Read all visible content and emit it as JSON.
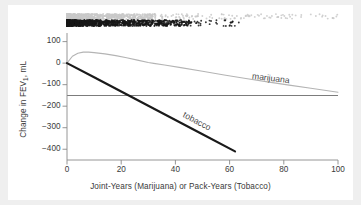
{
  "chart_data": {
    "type": "line",
    "title": "",
    "subtitle": "",
    "xlabel": "Joint-Years (Marijuana) or Pack-Years (Tobacco)",
    "ylabel": "Change in FEV1, mL",
    "ylabel_prefix": "Change in FEV",
    "ylabel_sub": "1",
    "ylabel_suffix": ", mL",
    "xlim": [
      0,
      100
    ],
    "ylim": [
      -450,
      140
    ],
    "xticks": [
      0,
      20,
      40,
      60,
      80,
      100
    ],
    "xtick_labels": [
      "0",
      "20",
      "40",
      "60",
      "80",
      "100"
    ],
    "yticks": [
      100,
      0,
      -100,
      -200,
      -300,
      -400
    ],
    "ytick_labels": [
      "100",
      "0",
      "−100",
      "−200",
      "−300",
      "−400"
    ],
    "grid": false,
    "legend_position": "inline-annotations",
    "zero_reference_line": 0,
    "series": [
      {
        "name": "marijuana",
        "label": "marijuana",
        "color": "#b4b4b4",
        "line_width": 1.1,
        "x": [
          0,
          2,
          4,
          6,
          8,
          10,
          14,
          18,
          22,
          26,
          30,
          32,
          36,
          42,
          50,
          58,
          66,
          74,
          82,
          90,
          100
        ],
        "values": [
          0,
          32,
          46,
          51,
          51,
          49,
          43,
          35,
          25,
          14,
          3,
          -1,
          -9,
          -21,
          -38,
          -55,
          -71,
          -87,
          -102,
          -117,
          -135
        ]
      },
      {
        "name": "tobacco",
        "label": "tobacco",
        "color": "#1a1a1a",
        "line_width": 2.2,
        "x": [
          0,
          10,
          20,
          30,
          40,
          50,
          62
        ],
        "values": [
          0,
          -66,
          -132,
          -198,
          -264,
          -330,
          -410
        ]
      }
    ],
    "rug_plots": [
      {
        "name": "marijuana-rug",
        "color": "#c9c9c9",
        "y_position": 14,
        "band_height": 5,
        "x_range": [
          0,
          100
        ],
        "dense_until": 33,
        "description": "gray density rug of marijuana joint-year exposures"
      },
      {
        "name": "tobacco-rug",
        "color": "#171717",
        "y_position": 20,
        "band_height": 6,
        "x_range": [
          0,
          64
        ],
        "dense_until": 46,
        "description": "black density rug of tobacco pack-year exposures"
      }
    ]
  },
  "annotations": {
    "marijuana_label": "marijuana",
    "tobacco_label": "tobacco"
  }
}
